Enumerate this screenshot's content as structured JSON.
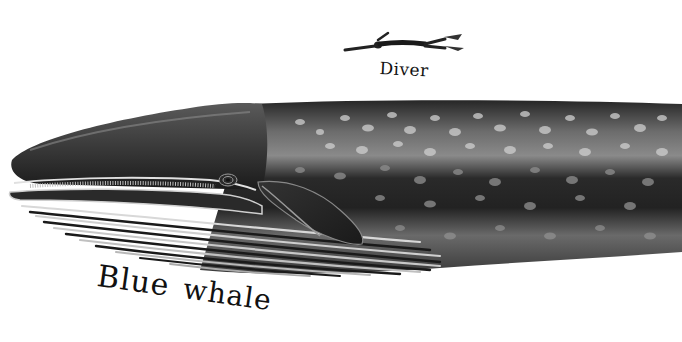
{
  "illustration": {
    "subject": "blue-whale-size-comparison",
    "labels": {
      "diver": "Diver",
      "whale_word1": "Blue",
      "whale_word2": "whale"
    },
    "colors": {
      "background": "#ffffff",
      "whale_dark": "#1c1c1c",
      "whale_mid": "#4a4a4a",
      "whale_light": "#9a9a9a",
      "spots": "#c8c8c8",
      "label_ink": "#111111"
    }
  }
}
